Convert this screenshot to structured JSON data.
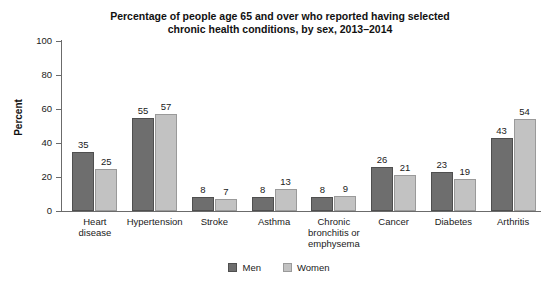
{
  "chart_data": {
    "type": "bar",
    "title": "Percentage of people age 65 and over who reported having selected chronic health conditions, by sex, 2013–2014",
    "title_lines": [
      "Percentage of people age 65 and over who reported having selected",
      "chronic health conditions, by sex, 2013–2014"
    ],
    "categories": [
      "Heart disease",
      "Hypertension",
      "Stroke",
      "Asthma",
      "Chronic bronchitis or emphysema",
      "Cancer",
      "Diabetes",
      "Arthritis"
    ],
    "category_lines": [
      [
        "Heart",
        "disease"
      ],
      [
        "Hypertension"
      ],
      [
        "Stroke"
      ],
      [
        "Asthma"
      ],
      [
        "Chronic",
        "bronchitis or",
        "emphysema"
      ],
      [
        "Cancer"
      ],
      [
        "Diabetes"
      ],
      [
        "Arthritis"
      ]
    ],
    "series": [
      {
        "name": "Men",
        "color": "#6e6e6e",
        "values": [
          35,
          55,
          8,
          8,
          8,
          26,
          23,
          43
        ]
      },
      {
        "name": "Women",
        "color": "#c2c2c2",
        "values": [
          25,
          57,
          7,
          13,
          9,
          21,
          19,
          54
        ]
      }
    ],
    "xlabel": "",
    "ylabel": "Percent",
    "ylim": [
      0,
      100
    ],
    "yticks": [
      0,
      20,
      40,
      60,
      80,
      100
    ],
    "ytick_labels": [
      "0",
      "20",
      "40",
      "60",
      "80",
      "100"
    ],
    "grid": false,
    "legend_position": "bottom"
  },
  "legend": {
    "items": [
      {
        "label": "Men"
      },
      {
        "label": "Women"
      }
    ]
  }
}
